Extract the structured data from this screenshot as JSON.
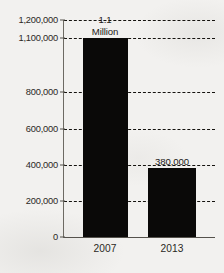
{
  "chart_data": {
    "type": "bar",
    "title": "",
    "xlabel": "",
    "ylabel": "",
    "categories": [
      "2007",
      "2013"
    ],
    "values": [
      1100000,
      380000
    ],
    "value_labels": [
      {
        "line1": "1.1",
        "line2": "Million"
      },
      {
        "line1": "380,000",
        "line2": ""
      }
    ],
    "ylim": [
      0,
      1200000
    ],
    "ytick_labels": [
      "1,200,000",
      "1,100,000",
      "800,000",
      "600,000",
      "400,000",
      "200,000",
      "0"
    ],
    "ytick_values": [
      1200000,
      1100000,
      800000,
      600000,
      400000,
      200000,
      0
    ],
    "grid": true,
    "grid_style": "dashed",
    "legend": "none",
    "bar_color": "#0a0908",
    "background_color": "#f2f1ef",
    "axis_color": "#55524c",
    "text_color": "#2b2824"
  }
}
